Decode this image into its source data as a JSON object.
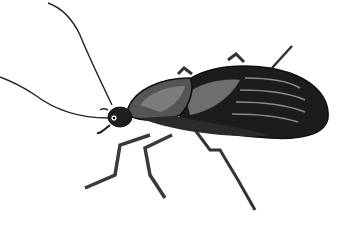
{
  "image": {
    "subject": "beetle illustration",
    "background": "#ffffff",
    "colors": {
      "body_dark": "#1a1a1a",
      "body_mid": "#3c3c3c",
      "highlight": "#7a7a7a",
      "stripe": "#9a9a9a",
      "leg": "#4a4a4a",
      "outline": "#111111"
    }
  }
}
